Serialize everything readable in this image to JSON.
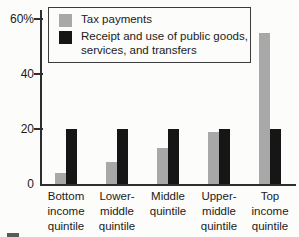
{
  "figure": {
    "background_color": "#fcfcfa",
    "axis_color": "#2e2e2e",
    "text_color": "#1b1b1b"
  },
  "chart_data": {
    "type": "bar",
    "title": "",
    "xlabel": "",
    "ylabel": "",
    "categories": [
      "Bottom income quintile",
      "Lower-middle quintile",
      "Middle quintile",
      "Upper-middle quintile",
      "Top income quintile"
    ],
    "category_lines": [
      [
        "Bottom",
        "income",
        "quintile"
      ],
      [
        "Lower-",
        "middle",
        "quintile"
      ],
      [
        "Middle",
        "quintile"
      ],
      [
        "Upper-",
        "middle",
        "quintile"
      ],
      [
        "Top",
        "income",
        "quintile"
      ]
    ],
    "series": [
      {
        "name": "Tax payments",
        "color": "#a8a8a8",
        "values": [
          4,
          8,
          13,
          19,
          55
        ]
      },
      {
        "name": "Receipt and use of public goods, services, and transfers",
        "color": "#161616",
        "values": [
          20,
          20,
          20,
          20,
          20
        ]
      }
    ],
    "y_ticks": [
      0,
      20,
      40,
      60
    ],
    "y_tick_labels": [
      "0",
      "20",
      "40",
      "60%"
    ],
    "ylim": [
      0,
      63
    ],
    "grid": false,
    "legend_position": "top-inside",
    "legend": {
      "entries": [
        {
          "swatch_color": "#a8a8a8",
          "label_lines": [
            "Tax payments"
          ]
        },
        {
          "swatch_color": "#161616",
          "label_lines": [
            "Receipt and use of public goods,",
            "services, and transfers"
          ]
        }
      ]
    }
  }
}
